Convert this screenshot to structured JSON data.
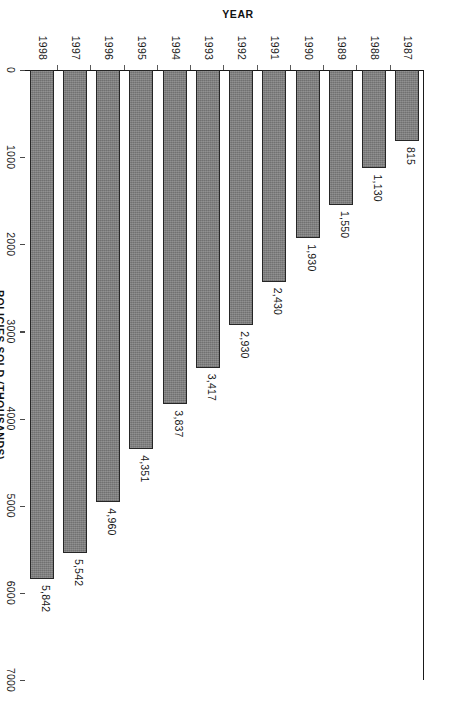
{
  "chart_data": {
    "type": "bar",
    "orientation": "horizontal",
    "title": "",
    "xlabel": "POLICIES SOLD (THOUSANDS)",
    "ylabel": "YEAR",
    "categories": [
      "1987",
      "1988",
      "1989",
      "1990",
      "1991",
      "1992",
      "1993",
      "1994",
      "1995",
      "1996",
      "1997",
      "1998"
    ],
    "values": [
      815,
      1130,
      1550,
      1930,
      2430,
      2930,
      3417,
      3837,
      4351,
      4960,
      5542,
      5842
    ],
    "value_labels": [
      "815",
      "1,130",
      "1,550",
      "1,930",
      "2,430",
      "2,930",
      "3,417",
      "3,837",
      "4,351",
      "4,960",
      "5,542",
      "5,842"
    ],
    "xlim": [
      0,
      7000
    ],
    "ticks": [
      0,
      1000,
      2000,
      3000,
      4000,
      5000,
      6000,
      7000
    ],
    "tick_labels": [
      "0",
      "1000",
      "2000",
      "3000",
      "4000",
      "5000",
      "6000",
      "7000"
    ],
    "grid": false,
    "legend": false,
    "bar_color": "#7c7c7c",
    "bar_edge_color": "#262626",
    "axis_color": "#1a1a1a",
    "background": "#ffffff"
  },
  "axes": {
    "value_axis_title": "POLICIES SOLD (THOUSANDS)",
    "category_axis_title": "YEAR"
  }
}
